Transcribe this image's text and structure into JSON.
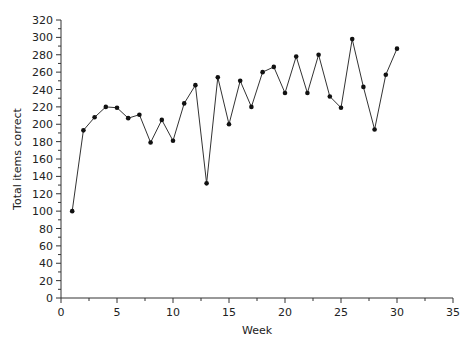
{
  "chart_data": {
    "type": "line",
    "title": "",
    "xlabel": "Week",
    "ylabel": "Total items correct",
    "xlim": [
      0,
      35
    ],
    "ylim": [
      0,
      320
    ],
    "x_ticks": [
      0,
      5,
      10,
      15,
      20,
      25,
      30,
      35
    ],
    "y_ticks": [
      0,
      20,
      40,
      60,
      80,
      100,
      120,
      140,
      160,
      180,
      200,
      220,
      240,
      260,
      280,
      300,
      320
    ],
    "grid": false,
    "legend": null,
    "x": [
      1,
      2,
      3,
      4,
      5,
      6,
      7,
      8,
      9,
      10,
      11,
      12,
      13,
      14,
      15,
      16,
      17,
      18,
      19,
      20,
      21,
      22,
      23,
      24,
      25,
      26,
      27,
      28,
      29,
      30
    ],
    "series": [
      {
        "name": "Total items correct",
        "values": [
          100,
          193,
          208,
          220,
          219,
          207,
          211,
          179,
          205,
          181,
          224,
          245,
          132,
          254,
          200,
          250,
          220,
          260,
          266,
          236,
          278,
          236,
          280,
          232,
          219,
          298,
          243,
          194,
          257,
          287
        ]
      }
    ],
    "colors": {
      "line": "#333333",
      "marker": "#111111",
      "axis": "#333333"
    }
  }
}
